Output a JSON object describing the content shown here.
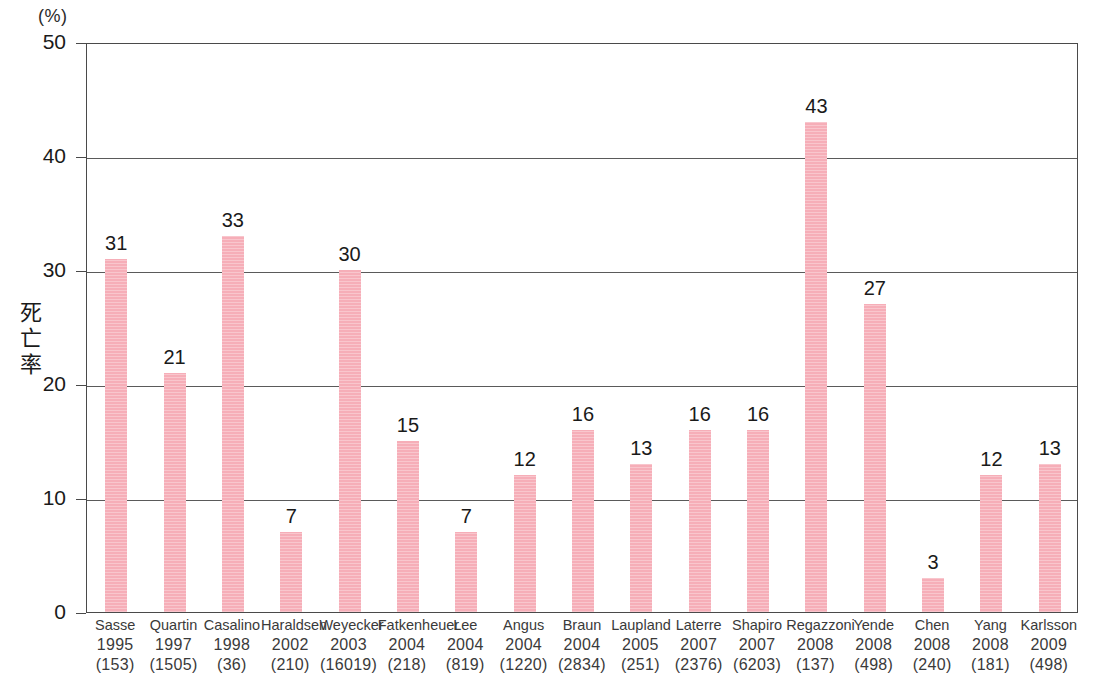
{
  "chart_data": {
    "type": "bar",
    "title": "",
    "subtitle": "",
    "xlabel": "",
    "ylabel": "死亡率",
    "unit_label": "(%)",
    "ylim": [
      0,
      50
    ],
    "yticks": [
      0,
      10,
      20,
      30,
      40,
      50
    ],
    "ytick_labels": [
      "0",
      "10",
      "20",
      "30",
      "40",
      "50"
    ],
    "grid": "horizontal",
    "legend": "none",
    "bar_color": "#f6aeb8",
    "axis_color": "#4a4a4a",
    "label_color": "#3a3a3a",
    "categories": [
      "Sasse 1995 (153)",
      "Quartin 1997 (1505)",
      "Casalino 1998 (36)",
      "Haraldsen 2002 (210)",
      "Weyecker 2003 (16019)",
      "Fatkenheuer 2004 (218)",
      "Lee 2004 (819)",
      "Angus 2004 (1220)",
      "Braun 2004 (2834)",
      "Laupland 2005 (251)",
      "Laterre 2007 (2376)",
      "Shapiro 2007 (6203)",
      "Regazzoni 2008 (137)",
      "Yende 2008 (498)",
      "Chen 2008 (240)",
      "Yang 2008 (181)",
      "Karlsson 2009 (498)"
    ],
    "values": [
      31,
      21,
      33,
      7,
      30,
      15,
      7,
      12,
      16,
      13,
      16,
      16,
      43,
      27,
      3,
      12,
      13
    ],
    "bars": [
      {
        "author": "Sasse",
        "year": "1995",
        "n": "(153)",
        "value": 31,
        "label": "31"
      },
      {
        "author": "Quartin",
        "year": "1997",
        "n": "(1505)",
        "value": 21,
        "label": "21"
      },
      {
        "author": "Casalino",
        "year": "1998",
        "n": "(36)",
        "value": 33,
        "label": "33"
      },
      {
        "author": "Haraldsen",
        "year": "2002",
        "n": "(210)",
        "value": 7,
        "label": "7"
      },
      {
        "author": "Weyecker",
        "year": "2003",
        "n": "(16019)",
        "value": 30,
        "label": "30"
      },
      {
        "author": "Fatkenheuer",
        "year": "2004",
        "n": "(218)",
        "value": 15,
        "label": "15"
      },
      {
        "author": "Lee",
        "year": "2004",
        "n": "(819)",
        "value": 7,
        "label": "7"
      },
      {
        "author": "Angus",
        "year": "2004",
        "n": "(1220)",
        "value": 12,
        "label": "12"
      },
      {
        "author": "Braun",
        "year": "2004",
        "n": "(2834)",
        "value": 16,
        "label": "16"
      },
      {
        "author": "Laupland",
        "year": "2005",
        "n": "(251)",
        "value": 13,
        "label": "13"
      },
      {
        "author": "Laterre",
        "year": "2007",
        "n": "(2376)",
        "value": 16,
        "label": "16"
      },
      {
        "author": "Shapiro",
        "year": "2007",
        "n": "(6203)",
        "value": 16,
        "label": "16"
      },
      {
        "author": "Regazzoni",
        "year": "2008",
        "n": "(137)",
        "value": 43,
        "label": "43"
      },
      {
        "author": "Yende",
        "year": "2008",
        "n": "(498)",
        "value": 27,
        "label": "27"
      },
      {
        "author": "Chen",
        "year": "2008",
        "n": "(240)",
        "value": 3,
        "label": "3"
      },
      {
        "author": "Yang",
        "year": "2008",
        "n": "(181)",
        "value": 12,
        "label": "12"
      },
      {
        "author": "Karlsson",
        "year": "2009",
        "n": "(498)",
        "value": 13,
        "label": "13"
      }
    ]
  }
}
